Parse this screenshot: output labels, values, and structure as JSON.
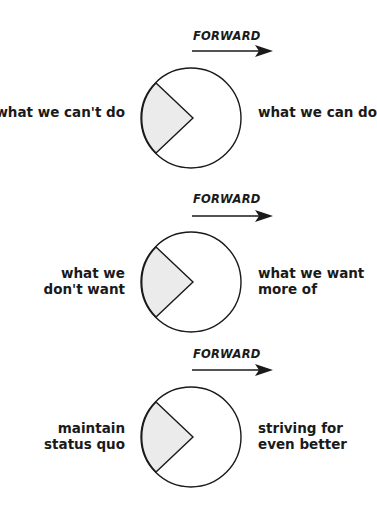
{
  "colors": {
    "stroke": "#1a1a1a",
    "wedge_fill": "#ebebeb",
    "background": "#ffffff"
  },
  "panels": [
    {
      "direction_label": "FORWARD",
      "arrow_icon": "right-arrow-icon",
      "left_label": [
        "what we can't do"
      ],
      "right_label": [
        "what we can do"
      ]
    },
    {
      "direction_label": "FORWARD",
      "arrow_icon": "right-arrow-icon",
      "left_label": [
        "what we",
        "don't want"
      ],
      "right_label": [
        "what we want",
        "more of"
      ]
    },
    {
      "direction_label": "FORWARD",
      "arrow_icon": "right-arrow-icon",
      "left_label": [
        "maintain",
        "status quo"
      ],
      "right_label": [
        "striving for",
        "even better"
      ]
    }
  ]
}
